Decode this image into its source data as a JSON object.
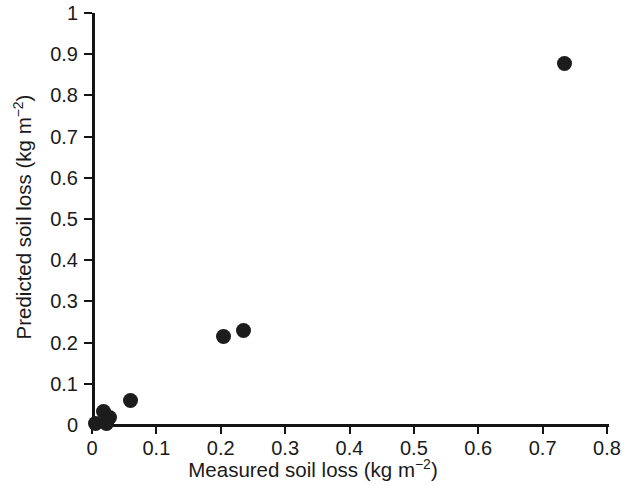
{
  "chart_data": {
    "type": "scatter",
    "title": "",
    "xlabel": "Measured soil loss (kg m−2)",
    "ylabel": "Predicted soil loss (kg m−2)",
    "xlabel_text": "Measured soil loss (kg m",
    "ylabel_text": "Predicted soil loss (kg m",
    "unit_exponent": "−2",
    "unit_close": ")",
    "xlim": [
      0,
      0.8
    ],
    "ylim": [
      0,
      1
    ],
    "xticks": [
      0,
      0.1,
      0.2,
      0.3,
      0.4,
      0.5,
      0.6,
      0.7,
      0.8
    ],
    "xtick_labels": [
      "0",
      "0.1",
      "0.2",
      "0.3",
      "0.4",
      "0.5",
      "0.6",
      "0.7",
      "0.8"
    ],
    "yticks": [
      0,
      0.1,
      0.2,
      0.3,
      0.4,
      0.5,
      0.6,
      0.7,
      0.8,
      0.9,
      1
    ],
    "ytick_labels": [
      "0",
      "0.1",
      "0.2",
      "0.3",
      "0.4",
      "0.5",
      "0.6",
      "0.7",
      "0.8",
      "0.9",
      "1"
    ],
    "grid": false,
    "legend": false,
    "marker": "filled-circle",
    "marker_color": "#1c1c1c",
    "axis_color": "#141414",
    "background_color": "#ffffff",
    "series": [
      {
        "name": "soil loss observations",
        "points": [
          {
            "x": 0.005,
            "y": 0.004
          },
          {
            "x": 0.018,
            "y": 0.033
          },
          {
            "x": 0.027,
            "y": 0.019
          },
          {
            "x": 0.022,
            "y": 0.004
          },
          {
            "x": 0.06,
            "y": 0.06
          },
          {
            "x": 0.205,
            "y": 0.214
          },
          {
            "x": 0.236,
            "y": 0.23
          },
          {
            "x": 0.734,
            "y": 0.877
          }
        ]
      }
    ]
  }
}
